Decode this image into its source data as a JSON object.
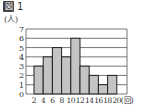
{
  "figure": {
    "title_glyph": "図",
    "title_number": "1",
    "unit_y": "(人)",
    "unit_x": "(回)"
  },
  "chart_data": {
    "type": "bar",
    "subtype": "histogram",
    "title": "図 1",
    "xlabel": "(回)",
    "ylabel": "(人)",
    "bin_edges": [
      2,
      4,
      6,
      8,
      10,
      12,
      14,
      16,
      18,
      20
    ],
    "x_tick_labels": [
      "2",
      "4",
      "6",
      "8",
      "10",
      "12",
      "14",
      "16",
      "18",
      "20"
    ],
    "categories": [
      "2-4",
      "4-6",
      "6-8",
      "8-10",
      "10-12",
      "12-14",
      "14-16",
      "16-18",
      "18-20"
    ],
    "values": [
      3,
      4,
      5,
      4,
      6,
      3,
      2,
      1,
      2
    ],
    "y_ticks": [
      0,
      1,
      2,
      3,
      4,
      5,
      6,
      7
    ],
    "ylim": [
      0,
      7
    ],
    "grid": true,
    "legend": null
  },
  "colors": {
    "bar_fill": "#c4c4c4",
    "bar_stroke": "#222222",
    "grid": "#555555",
    "text": "#333333"
  }
}
